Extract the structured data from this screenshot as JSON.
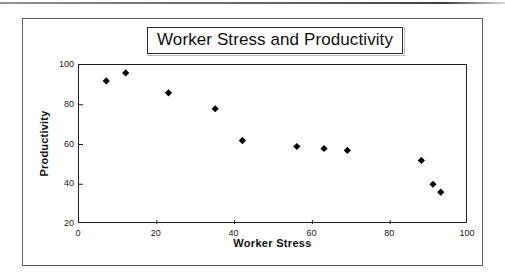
{
  "chart_data": {
    "type": "scatter",
    "title": "Worker Stress and Productivity",
    "xlabel": "Worker Stress",
    "ylabel": "Productivity",
    "xlim": [
      0,
      100
    ],
    "ylim": [
      20,
      100
    ],
    "xticks": [
      "0",
      "20",
      "40",
      "60",
      "80",
      "100"
    ],
    "xtick_values": [
      0,
      20,
      40,
      60,
      80,
      100
    ],
    "yticks": [
      "20",
      "40",
      "60",
      "80",
      "100"
    ],
    "ytick_values": [
      20,
      40,
      60,
      80,
      100
    ],
    "grid": false,
    "legend": false,
    "marker": "diamond",
    "marker_color": "#000000",
    "series": [
      {
        "name": "Worker Stress vs Productivity",
        "points": [
          {
            "x": 7,
            "y": 92
          },
          {
            "x": 12,
            "y": 96
          },
          {
            "x": 23,
            "y": 86
          },
          {
            "x": 35,
            "y": 78
          },
          {
            "x": 42,
            "y": 62
          },
          {
            "x": 56,
            "y": 59
          },
          {
            "x": 63,
            "y": 58
          },
          {
            "x": 69,
            "y": 57
          },
          {
            "x": 88,
            "y": 52
          },
          {
            "x": 91,
            "y": 40
          },
          {
            "x": 93,
            "y": 36
          }
        ]
      }
    ]
  },
  "colors": {
    "marker": "#000000",
    "axis": "#1e1e1e",
    "frame": "#5d5d62",
    "text": "#101010",
    "background": "#ffffff"
  }
}
